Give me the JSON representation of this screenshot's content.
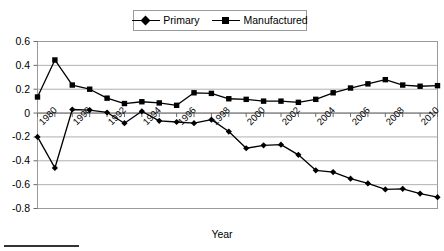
{
  "chart_data": {
    "type": "line",
    "title": "",
    "xlabel": "Year",
    "ylabel": "",
    "ylim": [
      -0.8,
      0.6
    ],
    "ytick_values": [
      0.6,
      0.4,
      0.2,
      0,
      -0.2,
      -0.4,
      -0.6,
      -0.8
    ],
    "ytick_labels": [
      "0.6",
      "0.4",
      "0.2",
      "0",
      "-0.2",
      "-0.4",
      "-0.6",
      "-0.8"
    ],
    "grid": "horizontal",
    "legend_position": "top-center",
    "x": [
      1980,
      1989,
      1990,
      1991,
      1992,
      1993,
      1994,
      1995,
      1996,
      1997,
      1998,
      1999,
      2000,
      2001,
      2002,
      2003,
      2004,
      2005,
      2006,
      2007,
      2008,
      2009,
      2010,
      2011
    ],
    "xtick_labels": [
      "1980",
      "1990",
      "1992",
      "1994",
      "1996",
      "1998",
      "2000",
      "2002",
      "2004",
      "2006",
      "2008",
      "2010"
    ],
    "series": [
      {
        "name": "Primary",
        "marker": "diamond",
        "color": "#000000",
        "values": [
          -0.2,
          -0.46,
          0.03,
          0.025,
          0.005,
          -0.085,
          0.015,
          -0.065,
          -0.075,
          -0.085,
          -0.055,
          -0.155,
          -0.295,
          -0.27,
          -0.265,
          -0.35,
          -0.48,
          -0.495,
          -0.55,
          -0.59,
          -0.64,
          -0.635,
          -0.675,
          -0.705
        ]
      },
      {
        "name": "Manufactured",
        "marker": "square",
        "color": "#000000",
        "values": [
          0.135,
          0.445,
          0.235,
          0.2,
          0.125,
          0.08,
          0.095,
          0.085,
          0.065,
          0.17,
          0.165,
          0.12,
          0.115,
          0.1,
          0.1,
          0.09,
          0.115,
          0.17,
          0.21,
          0.245,
          0.28,
          0.235,
          0.225,
          0.23
        ]
      }
    ]
  },
  "legend": {
    "entries": [
      {
        "label": "Primary",
        "marker": "diamond-icon"
      },
      {
        "label": "Manufactured",
        "marker": "square-icon"
      }
    ]
  },
  "axis": {
    "x_title": "Year"
  }
}
